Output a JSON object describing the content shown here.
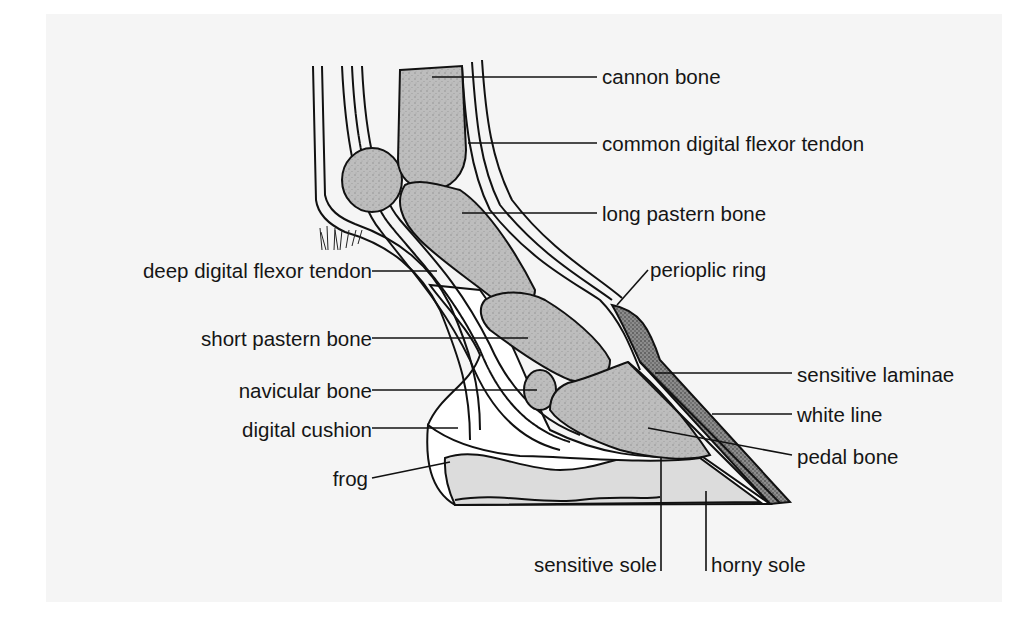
{
  "diagram": {
    "labels": {
      "cannon_bone": "cannon bone",
      "common_digital_flexor_tendon": "common digital flexor tendon",
      "long_pastern_bone": "long pastern bone",
      "deep_digital_flexor_tendon": "deep digital flexor tendon",
      "perioplic_ring": "perioplic ring",
      "short_pastern_bone": "short pastern bone",
      "sensitive_laminae": "sensitive laminae",
      "navicular_bone": "navicular bone",
      "white_line": "white line",
      "digital_cushion": "digital cushion",
      "pedal_bone": "pedal bone",
      "frog": "frog",
      "sensitive_sole": "sensitive sole",
      "horny_sole": "horny sole"
    },
    "colors": {
      "background": "#f5f5f5",
      "line": "#111111",
      "bone_fill": "#b8b8b8",
      "light_fill": "#dcdcdc"
    }
  }
}
